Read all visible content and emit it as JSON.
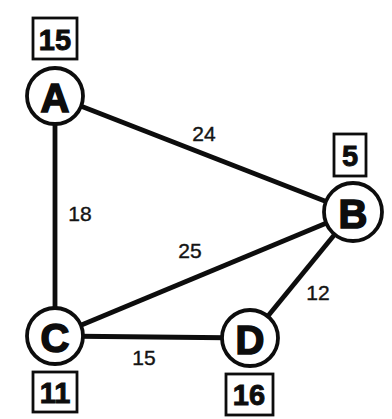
{
  "diagram": {
    "type": "weighted-undirected-graph",
    "colors": {
      "ink": "#0d0d0d",
      "paper": "#ffffff"
    },
    "nodes": [
      {
        "label": "A",
        "box_value": "15"
      },
      {
        "label": "B",
        "box_value": "5"
      },
      {
        "label": "C",
        "box_value": "11"
      },
      {
        "label": "D",
        "box_value": "16"
      }
    ],
    "edges": [
      {
        "from": "A",
        "to": "B",
        "weight": "24"
      },
      {
        "from": "A",
        "to": "C",
        "weight": "18"
      },
      {
        "from": "C",
        "to": "B",
        "weight": "25"
      },
      {
        "from": "C",
        "to": "D",
        "weight": "15"
      },
      {
        "from": "D",
        "to": "B",
        "weight": "12"
      }
    ]
  }
}
